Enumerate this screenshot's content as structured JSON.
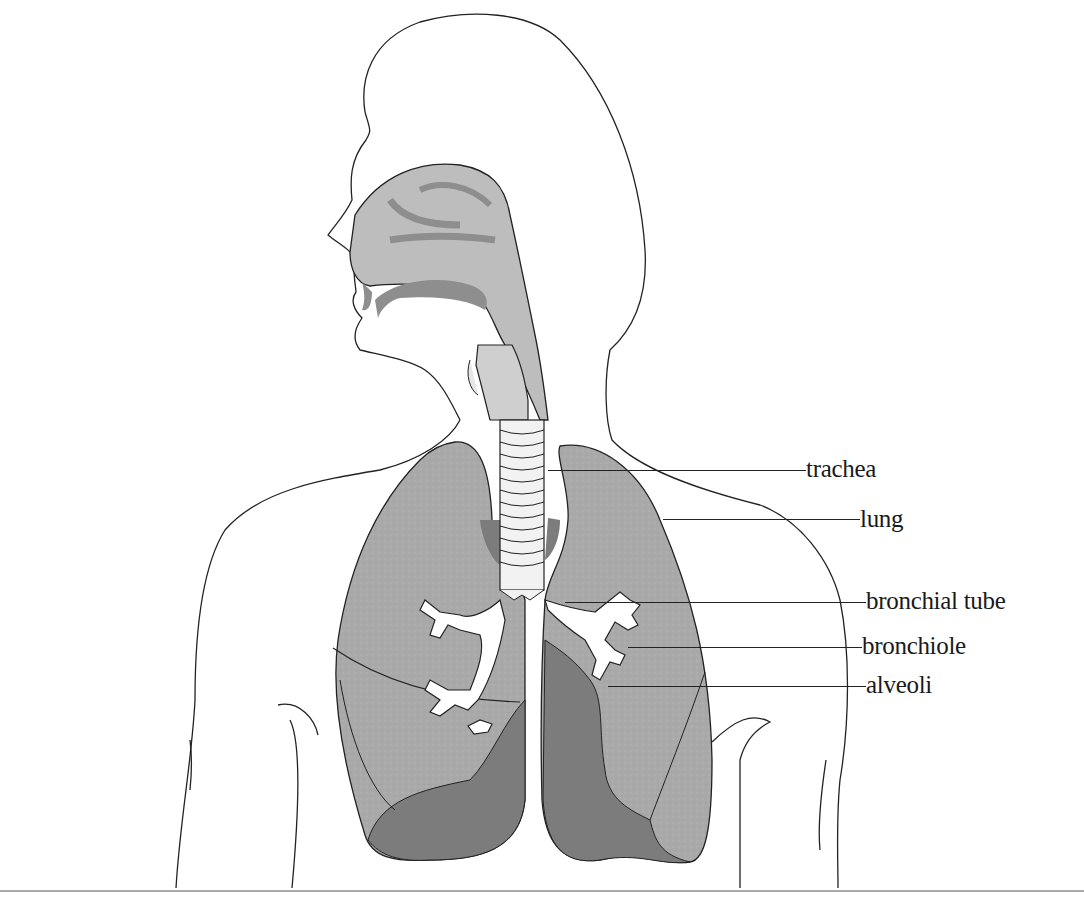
{
  "diagram": {
    "colors": {
      "outline": "#222222",
      "lung_fill": "#a9a9a9",
      "lung_dark": "#7c7c7c",
      "airway_fill": "#bdbdbd",
      "airway_dark": "#8e8e8e",
      "trachea_fill": "#f2f2f2",
      "background": "#ffffff"
    },
    "labels": [
      {
        "id": "trachea",
        "text": "trachea",
        "x": 806,
        "y": 456,
        "line_from": 548,
        "line_y": 470
      },
      {
        "id": "lung",
        "text": "lung",
        "x": 860,
        "y": 506,
        "line_from": 663,
        "line_y": 519
      },
      {
        "id": "bronchial-tube",
        "text": "bronchial tube",
        "x": 866,
        "y": 588,
        "line_from": 565,
        "line_y": 602
      },
      {
        "id": "bronchiole",
        "text": "bronchiole",
        "x": 862,
        "y": 633,
        "line_from": 628,
        "line_y": 647
      },
      {
        "id": "alveoli",
        "text": "alveoli",
        "x": 866,
        "y": 672,
        "line_from": 608,
        "line_y": 686
      }
    ]
  }
}
